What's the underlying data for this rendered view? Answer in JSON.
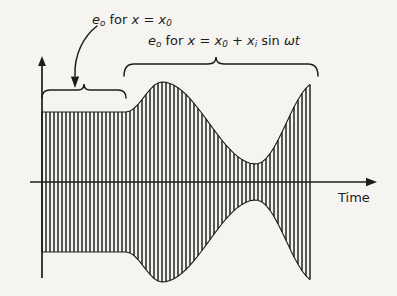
{
  "figure": {
    "background_color": "#f6f4f1",
    "ink_color": "#1c1c1c",
    "axis": {
      "time_axis_label": "Time",
      "baseline_y": 182,
      "origin_x": 42
    },
    "annotations": {
      "static_label": {
        "prefix": "e",
        "sub0": "o",
        "middle": " for ",
        "var": "x",
        "equals": " = ",
        "var2": "x",
        "sub2": "0"
      },
      "modulated_label": {
        "prefix": "e",
        "sub0": "o",
        "middle": " for ",
        "var": "x",
        "equals": " = ",
        "var2": "x",
        "sub2": "0",
        "plus": " + ",
        "var3": "x",
        "sub3": "i",
        "trig": " sin ",
        "omega": "ω",
        "t": "t"
      },
      "static_label_text": "e_o for x = x_0",
      "modulated_label_text": "e_o for x = x_0 + x_i sin ωt",
      "pointer_arrow": "curved-arrow-down-left"
    },
    "braces": [
      {
        "name": "carrier-brace",
        "x_start": 42,
        "x_end": 126,
        "y": 90
      },
      {
        "name": "modulated-brace",
        "x_start": 124,
        "x_end": 318,
        "y": 64
      }
    ]
  },
  "chart_data": {
    "type": "line",
    "title": "",
    "subtitle": "",
    "xlabel": "Time",
    "ylabel": "",
    "grid": false,
    "legend": null,
    "series": [
      {
        "name": "carrier-constant-region",
        "x_start": 42,
        "x_end": 126,
        "envelope_amplitude": 70,
        "carrier_period_px": 8.0,
        "cycles": 10.5
      },
      {
        "name": "modulated-region",
        "x_start": 126,
        "x_end": 313,
        "carrier_period_px": 8.0,
        "envelope_type": "sinusoidal",
        "envelope_max_amplitude": 100,
        "envelope_min_amplitude": 18,
        "envelope_peak_x": 162,
        "envelope_trough_x": 256,
        "envelope_end_x": 313,
        "envelope_end_amplitude": 94
      }
    ],
    "axis_ranges": {
      "x": [
        42,
        375
      ],
      "y": [
        -105,
        105
      ]
    }
  }
}
